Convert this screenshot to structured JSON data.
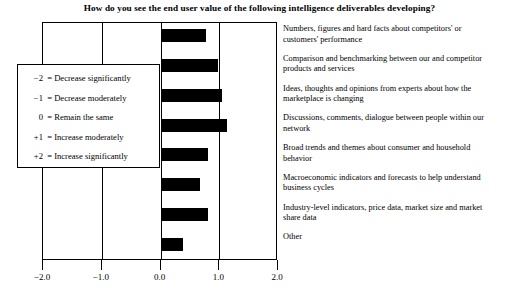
{
  "chart": {
    "title": "How do you see the end user value of the following intelligence deliverables developing?"
  },
  "legend": {
    "items": [
      {
        "key": "−2",
        "eq": "=",
        "text": "Decrease significantly"
      },
      {
        "key": "−1",
        "eq": "=",
        "text": "Decrease moderately"
      },
      {
        "key": "0",
        "eq": "=",
        "text": "Remain the same"
      },
      {
        "key": "+1",
        "eq": "=",
        "text": "Increase moderately"
      },
      {
        "key": "+2",
        "eq": "=",
        "text": "Increase significantly"
      }
    ]
  },
  "axis": {
    "ticks": [
      {
        "label": "−2.0",
        "value": -2
      },
      {
        "label": "−1.0",
        "value": -1
      },
      {
        "label": "0.0",
        "value": 0
      },
      {
        "label": "1.0",
        "value": 1
      },
      {
        "label": "2.0",
        "value": 2
      }
    ]
  },
  "chart_data": {
    "type": "bar",
    "title": "How do you see the end user value of the following intelligence deliverables developing?",
    "xlabel": "",
    "ylabel": "",
    "xlim": [
      -2.0,
      2.0
    ],
    "grid": true,
    "orientation": "horizontal",
    "legend_position": "inside-left",
    "legend_entries": [
      "−2 = Decrease significantly",
      "−1 = Decrease moderately",
      "0 = Remain the same",
      "+1 = Increase moderately",
      "+2 = Increase significantly"
    ],
    "xticks": [
      -2.0,
      -1.0,
      0.0,
      1.0,
      2.0
    ],
    "xticklabels": [
      "−2.0",
      "−1.0",
      "0.0",
      "1.0",
      "2.0"
    ],
    "categories": [
      "Numbers, figures and hard facts about competitors' or customers' performance",
      "Comparison and benchmarking between our and competitor products and services",
      "Ideas, thoughts and opinions from experts about how the marketplace is changing",
      "Discussions, comments, dialogue between people within our network",
      "Broad trends and themes about consumer and household behavior",
      "Macroeconomic indicators and forecasts to help understand business cycles",
      "Industry-level indicators, price data, market size and market share data",
      "Other"
    ],
    "values": [
      0.78,
      0.98,
      1.05,
      1.13,
      0.8,
      0.68,
      0.81,
      0.39
    ]
  },
  "categories": [
    {
      "line1": "Numbers, figures and hard facts about competitors' or",
      "line2": "customers' performance"
    },
    {
      "line1": "Comparison and benchmarking between our and competitor",
      "line2": "products and services"
    },
    {
      "line1": "Ideas, thoughts and opinions from experts about how the",
      "line2": "marketplace is changing"
    },
    {
      "line1": "Discussions, comments, dialogue between people within our",
      "line2": "network"
    },
    {
      "line1": "Broad trends and themes about consumer and household",
      "line2": "behavior"
    },
    {
      "line1": "Macroeconomic indicators and forecasts to help understand",
      "line2": "business cycles"
    },
    {
      "line1": "Industry-level indicators, price data, market size and market",
      "line2": "share data"
    },
    {
      "line1": "Other",
      "line2": ""
    }
  ]
}
